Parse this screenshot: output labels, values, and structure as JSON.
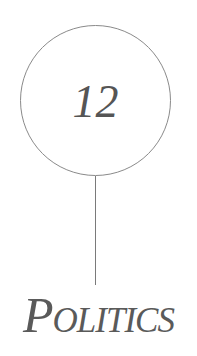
{
  "chapter": {
    "number": "12",
    "title": "Politics"
  },
  "colors": {
    "text": "#555555",
    "circle_stroke": "#8a8a8a",
    "line": "#7a7a7a",
    "background": "#ffffff"
  }
}
